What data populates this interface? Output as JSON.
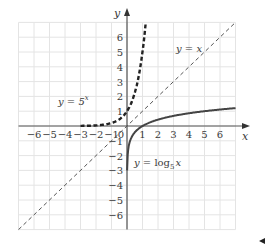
{
  "chart_data": {
    "type": "line",
    "title": "",
    "xlabel": "x",
    "ylabel": "y",
    "xlim": [
      -7,
      7
    ],
    "ylim": [
      -7,
      7
    ],
    "grid": true,
    "x_ticks": [
      -6,
      -5,
      -4,
      -3,
      -2,
      -1,
      1,
      2,
      3,
      4,
      5,
      6
    ],
    "y_ticks": [
      -6,
      -5,
      -4,
      -3,
      -2,
      -1,
      1,
      2,
      3,
      4,
      5,
      6
    ],
    "origin_label": "0",
    "series": [
      {
        "name": "y = 5^x",
        "label_parts": [
          "y = 5",
          "x"
        ],
        "style": "thick-dashed",
        "color": "#222222",
        "x": [
          -3,
          -2,
          -1,
          -0.5,
          0,
          0.5,
          0.8,
          1,
          1.1,
          1.19
        ],
        "y": [
          0.008,
          0.04,
          0.2,
          0.447,
          1,
          2.236,
          3.62,
          5,
          5.87,
          6.8
        ]
      },
      {
        "name": "y = x",
        "label_parts": [
          "y = x"
        ],
        "style": "thin-dashed",
        "color": "#555555",
        "x": [
          -7,
          7
        ],
        "y": [
          -7,
          7
        ]
      },
      {
        "name": "y = log_5 x",
        "label_parts": [
          "y = log",
          "5",
          "x"
        ],
        "style": "solid",
        "color": "#444444",
        "x": [
          0.008,
          0.04,
          0.2,
          0.5,
          1,
          2,
          3,
          4,
          5,
          6,
          7
        ],
        "y": [
          -3,
          -2,
          -1,
          -0.431,
          0,
          0.431,
          0.683,
          0.861,
          1,
          1.113,
          1.209
        ]
      }
    ],
    "annotations": [
      {
        "text": "y = 5^x",
        "at": [
          -4.3,
          1.6
        ]
      },
      {
        "text": "y = x",
        "at": [
          3.2,
          4.3
        ]
      },
      {
        "text": "y = log_5 x",
        "at": [
          1.2,
          -2.3
        ]
      }
    ]
  },
  "labels": {
    "x_axis": "x",
    "y_axis": "y",
    "origin": "0",
    "exp_base": "y = 5",
    "exp_power": "x",
    "identity": "y = x",
    "log_prefix": "y = log",
    "log_base": "5",
    "log_arg": "x"
  }
}
